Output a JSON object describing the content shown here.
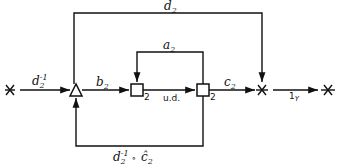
{
  "diagram": {
    "type": "signal-flow graph",
    "nodes": [
      {
        "id": "source",
        "shape": "star",
        "label": ""
      },
      {
        "id": "triangle",
        "shape": "triangle",
        "label": ""
      },
      {
        "id": "box1",
        "shape": "square",
        "label": "2"
      },
      {
        "id": "box2",
        "shape": "square",
        "label": "2"
      },
      {
        "id": "junction",
        "shape": "star",
        "label": ""
      },
      {
        "id": "sink",
        "shape": "star",
        "label": ""
      }
    ],
    "edges": [
      {
        "from": "source",
        "to": "triangle",
        "label": "d",
        "sup": "-1",
        "sub": "2"
      },
      {
        "from": "triangle",
        "to": "box1",
        "label": "b",
        "sub": "2"
      },
      {
        "from": "box1",
        "to": "box2",
        "label": "u.d."
      },
      {
        "from": "box2",
        "to": "box1",
        "label": "a",
        "sub": "2"
      },
      {
        "from": "box2",
        "to": "junction",
        "label": "c",
        "sub": "2"
      },
      {
        "from": "triangle",
        "to": "junction",
        "label": "d",
        "sub": "2"
      },
      {
        "from": "box2",
        "to": "triangle",
        "label": "d",
        "sup": "-1",
        "sub": "2",
        "suffix": " ∘ ĉ",
        "suffix_sub": "2"
      },
      {
        "from": "junction",
        "to": "sink",
        "label": "1",
        "sub": "Y"
      }
    ],
    "box_labels": {
      "box1": "2",
      "box2": "2"
    },
    "labels": {
      "top_d": "d",
      "top_d_sub": "2",
      "in_d": "d",
      "in_d_sup": "-1",
      "in_d_sub": "2",
      "b": "b",
      "b_sub": "2",
      "a": "a",
      "a_sub": "2",
      "ud": "u.d.",
      "c": "c",
      "c_sub": "2",
      "one": "1",
      "one_sub": "Y",
      "bot_d": "d",
      "bot_d_sup": "-1",
      "bot_d_sub": "2",
      "bot_op": "∘",
      "bot_c": "ĉ",
      "bot_c_sub": "2"
    }
  }
}
